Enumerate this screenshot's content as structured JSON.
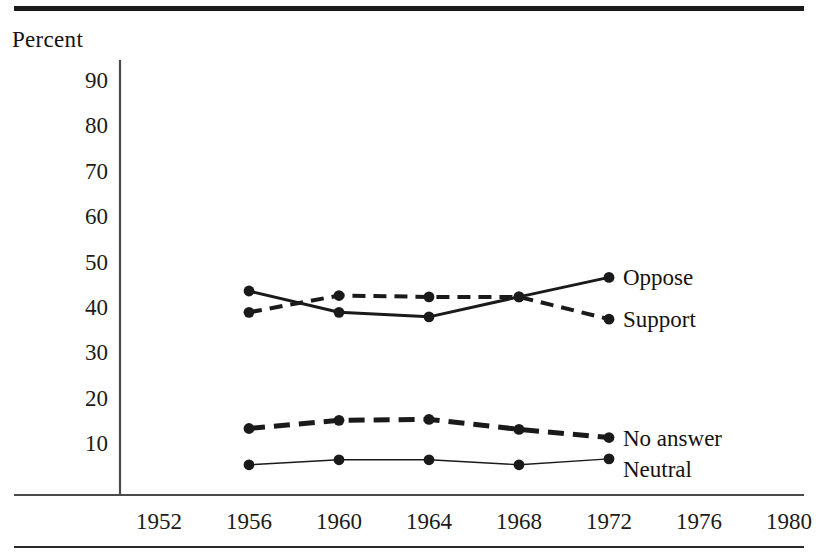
{
  "figure": {
    "y_axis_title": "Percent",
    "top_rule": true,
    "bottom_rule": true
  },
  "chart_data": {
    "type": "line",
    "title": "",
    "subtitle": "",
    "xlabel": "",
    "ylabel": "Percent",
    "x": [
      1952,
      1956,
      1960,
      1964,
      1968,
      1972,
      1976,
      1980
    ],
    "xtick_labels": [
      "1952",
      "1956",
      "1960",
      "1964",
      "1968",
      "1972",
      "1976",
      "1980"
    ],
    "xlim": [
      1950,
      1982
    ],
    "ylim": [
      0,
      95
    ],
    "ytick_values": [
      10,
      20,
      30,
      40,
      50,
      60,
      70,
      80,
      90
    ],
    "ytick_labels": [
      "10",
      "20",
      "30",
      "40",
      "50",
      "60",
      "70",
      "80",
      "90"
    ],
    "grid": false,
    "legend_position": "right-inline-at-line-end",
    "series": [
      {
        "name": "Oppose",
        "label": "Oppose",
        "style": "solid",
        "line_width": 3,
        "marker": "circle",
        "x": [
          1956,
          1960,
          1964,
          1968,
          1972
        ],
        "values": [
          43.5,
          38.8,
          37.8,
          42.2,
          46.5
        ]
      },
      {
        "name": "Support",
        "label": "Support",
        "style": "dashed",
        "line_width": 4,
        "marker": "circle",
        "x": [
          1956,
          1960,
          1964,
          1968,
          1972
        ],
        "values": [
          38.8,
          42.5,
          42.2,
          42.2,
          37.3
        ]
      },
      {
        "name": "No answer",
        "label": "No answer",
        "style": "dashed",
        "line_width": 5,
        "marker": "circle",
        "x": [
          1956,
          1960,
          1964,
          1968,
          1972
        ],
        "values": [
          13.2,
          15.0,
          15.2,
          13.0,
          11.2
        ]
      },
      {
        "name": "Neutral",
        "label": "Neutral",
        "style": "solid",
        "line_width": 1.4,
        "marker": "circle",
        "x": [
          1956,
          1960,
          1964,
          1968,
          1972
        ],
        "values": [
          5.2,
          6.3,
          6.3,
          5.2,
          6.5
        ]
      }
    ],
    "series_label_anchor": {
      "Oppose": 46.5,
      "Support": 37.3,
      "No answer": 11.2,
      "Neutral": 4.2
    },
    "colors": {
      "ink": "#1a1a1a",
      "axis": "#4a4a4a",
      "background": "#ffffff"
    }
  }
}
